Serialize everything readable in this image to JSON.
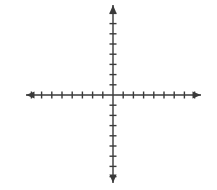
{
  "figure": {
    "kind": "cartesian-coordinate-plane",
    "title": "",
    "background_color": "#ffffff",
    "width": 217,
    "height": 190
  },
  "chart_data": {
    "type": "scatter",
    "title": "",
    "subtitle": "",
    "xlabel": "",
    "ylabel": "",
    "x": [],
    "y": [],
    "series": [],
    "annotations": [],
    "legend": null,
    "legend_position": "none",
    "grid": false,
    "xlim": [
      -8,
      8
    ],
    "ylim": [
      -9,
      9
    ],
    "xticks": [
      -8,
      -7,
      -6,
      -5,
      -4,
      -3,
      -2,
      -1,
      1,
      2,
      3,
      4,
      5,
      6,
      7,
      8
    ],
    "yticks": [
      -9,
      -8,
      -7,
      -6,
      -5,
      -4,
      -3,
      -2,
      -1,
      1,
      2,
      3,
      4,
      5,
      6,
      7,
      8
    ],
    "xtick_labels": [],
    "ytick_labels": []
  },
  "axes": {
    "stroke_color": "#3a3a3a",
    "stroke_width": 1.4,
    "tick_length": 7,
    "origin": {
      "x": 113,
      "y": 95
    },
    "tick_spacing": 10.2,
    "x_axis": {
      "name": "x-axis",
      "start_x": 26,
      "end_x": 201,
      "ticks_left": 8,
      "ticks_right": 8,
      "arrow_left": true,
      "arrow_right": true
    },
    "y_axis": {
      "name": "y-axis",
      "start_y": 5,
      "end_y": 183,
      "ticks_up": 8,
      "ticks_down": 8,
      "arrow_up": true,
      "arrow_down": true
    }
  }
}
